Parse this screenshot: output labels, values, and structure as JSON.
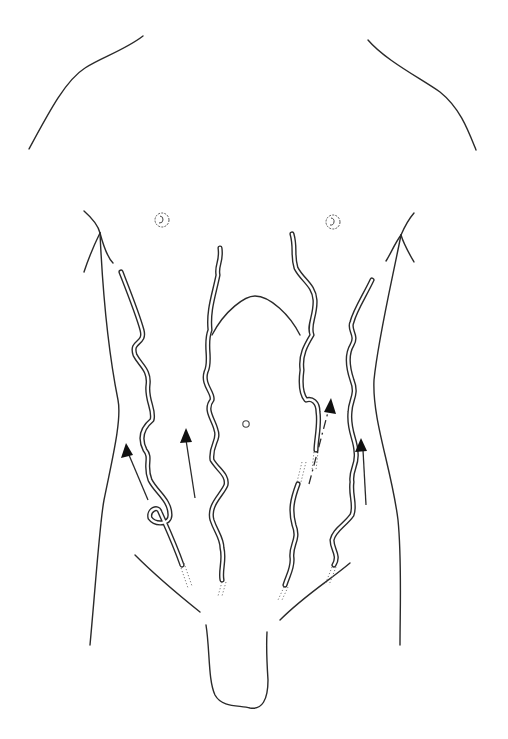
{
  "figure": {
    "background_color": "#ffffff",
    "line_color": "#2a2a2a",
    "arrow_color": "#111111",
    "labels": []
  },
  "anatomy": {
    "shoulders": [
      "left-shoulder",
      "right-shoulder"
    ],
    "nipples": [
      "left-nipple",
      "right-nipple"
    ],
    "landmarks": [
      "costal-arch",
      "umbilicus",
      "inguinal-folds",
      "genitalia-outline"
    ],
    "flank_outlines": [
      "left-flank",
      "right-flank"
    ]
  },
  "veins": [
    {
      "id": "left-lateral-vein",
      "side": "left",
      "style": "double-line tortuous"
    },
    {
      "id": "left-medial-vein",
      "side": "left",
      "style": "double-line tortuous"
    },
    {
      "id": "right-medial-vein",
      "side": "right",
      "style": "double-line tortuous"
    },
    {
      "id": "right-lateral-vein",
      "side": "right",
      "style": "double-line tortuous"
    }
  ],
  "arrows": [
    {
      "id": "arrow-1",
      "direction": "up",
      "position": "left-lateral",
      "line_style": "solid"
    },
    {
      "id": "arrow-2",
      "direction": "up",
      "position": "left-medial",
      "line_style": "solid"
    },
    {
      "id": "arrow-3",
      "direction": "up",
      "position": "right-medial",
      "line_style": "dash-dot"
    },
    {
      "id": "arrow-4",
      "direction": "up",
      "position": "right-lateral",
      "line_style": "solid"
    }
  ]
}
